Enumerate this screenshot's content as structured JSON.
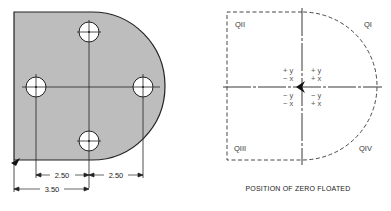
{
  "left_figure": {
    "description": "Plate with four-hole bolt pattern, dimensioned from left edge datum",
    "fill_color": "#bdbdbd",
    "dimensions": {
      "left_hole_to_center": "2.50",
      "center_to_right_hole": "2.50",
      "left_edge_to_center": "3.50"
    },
    "holes": [
      "top",
      "left",
      "right",
      "bottom"
    ]
  },
  "right_figure": {
    "quadrants": {
      "q1": "QI",
      "q2": "QII",
      "q3": "QIII",
      "q4": "QIV"
    },
    "signs": {
      "q2_y": "+ y",
      "q2_x": "− x",
      "q1_y": "+ y",
      "q1_x": "+ x",
      "q3_y": "− y",
      "q3_x": "− x",
      "q4_y": "− y",
      "q4_x": "+ x"
    },
    "caption": "POSITION OF ZERO FLOATED"
  }
}
